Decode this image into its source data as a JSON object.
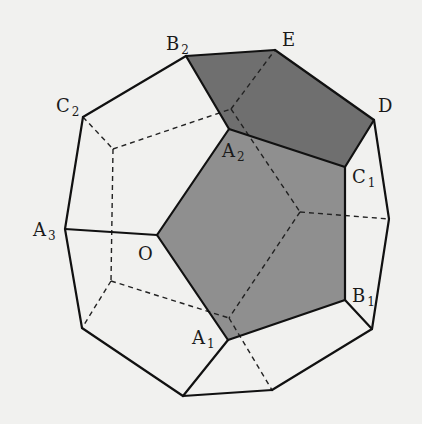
{
  "diagram": {
    "type": "regular dodecahedron with shaded faces",
    "colors": {
      "background": "#f1f1ef",
      "face_light": "#8f8f8f",
      "face_dark": "#6f6f6f",
      "edge": "#111111",
      "hidden_edge": "#222222"
    },
    "vertices": {
      "B2": [
        186,
        56
      ],
      "E": [
        275,
        50
      ],
      "D": [
        374,
        120
      ],
      "C1": [
        345,
        167
      ],
      "A2": [
        229,
        129
      ],
      "O": [
        157,
        235
      ],
      "A3": [
        65,
        229
      ],
      "C2": [
        83,
        117
      ],
      "B1": [
        345,
        300
      ],
      "A1": [
        228,
        340
      ],
      "P_bottom": [
        183,
        396
      ],
      "P_bottom_right": [
        272,
        390
      ],
      "P_right_low": [
        372,
        329
      ],
      "P_right_mid": [
        389,
        219
      ],
      "P_left_low": [
        82,
        328
      ]
    },
    "hidden_vertices": {
      "H_left_top": [
        113,
        149
      ],
      "H_left_low": [
        111,
        281
      ],
      "H_top": [
        231,
        109
      ],
      "H_right": [
        300,
        212
      ],
      "H_bottom": [
        229,
        318
      ]
    },
    "shaded_faces": [
      {
        "name": "face-O-A1-B1-C1-A2",
        "points": [
          "O",
          "A1",
          "B1",
          "C1",
          "A2"
        ],
        "shade": "light"
      },
      {
        "name": "face-A2-C1-D-E-B2",
        "points": [
          "A2",
          "C1",
          "D",
          "E",
          "B2"
        ],
        "shade": "dark"
      }
    ],
    "labels": [
      {
        "id": "B2",
        "base": "B",
        "sub": "2",
        "x": 166,
        "y": 50
      },
      {
        "id": "E",
        "base": "E",
        "sub": "",
        "x": 282,
        "y": 46
      },
      {
        "id": "C2",
        "base": "C",
        "sub": "2",
        "x": 56,
        "y": 112
      },
      {
        "id": "D",
        "base": "D",
        "sub": "",
        "x": 378,
        "y": 112
      },
      {
        "id": "A2",
        "base": "A",
        "sub": "2",
        "x": 222,
        "y": 157
      },
      {
        "id": "C1",
        "base": "C",
        "sub": "1",
        "x": 352,
        "y": 183
      },
      {
        "id": "A3",
        "base": "A",
        "sub": "3",
        "x": 33,
        "y": 236
      },
      {
        "id": "O",
        "base": "O",
        "sub": "",
        "x": 138,
        "y": 260
      },
      {
        "id": "B1",
        "base": "B",
        "sub": "1",
        "x": 352,
        "y": 302
      },
      {
        "id": "A1",
        "base": "A",
        "sub": "1",
        "x": 192,
        "y": 344
      }
    ]
  }
}
